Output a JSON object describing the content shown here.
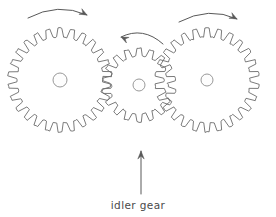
{
  "diagram": {
    "background_color": "#ffffff",
    "stroke_color": "#6b6b6b",
    "arrow_color": "#585858",
    "text_color": "#4a4a4a",
    "gears": [
      {
        "id": "left-gear",
        "role": "driver gear",
        "cx": 60,
        "cy": 80,
        "outer_radius": 52,
        "root_radius": 43,
        "teeth": 26,
        "hub_radius": 7,
        "rotation_direction": "clockwise"
      },
      {
        "id": "middle-gear",
        "role": "idler gear",
        "cx": 139,
        "cy": 85,
        "outer_radius": 37,
        "root_radius": 29,
        "teeth": 18,
        "hub_radius": 6,
        "rotation_direction": "counter-clockwise"
      },
      {
        "id": "right-gear",
        "role": "driven gear",
        "cx": 207,
        "cy": 80,
        "outer_radius": 52,
        "root_radius": 43,
        "teeth": 26,
        "hub_radius": 6,
        "rotation_direction": "clockwise"
      }
    ],
    "rotation_arrows": [
      {
        "id": "left-rotation-arrow",
        "direction": "clockwise",
        "path": "M 28,18 Q 58,2 87,15",
        "head_x": 87,
        "head_y": 15,
        "head_angle": 28
      },
      {
        "id": "middle-rotation-arrow",
        "direction": "counter-clockwise",
        "path": "M 163,44 Q 143,26 121,37",
        "head_x": 121,
        "head_y": 37,
        "head_angle": 205
      },
      {
        "id": "right-rotation-arrow",
        "direction": "clockwise",
        "path": "M 179,22 Q 209,6 237,19",
        "head_x": 237,
        "head_y": 19,
        "head_angle": 28
      }
    ],
    "pointer": {
      "id": "idler-pointer-arrow",
      "x": 141,
      "y_tail": 194,
      "y_head": 151,
      "direction": "up"
    },
    "label": {
      "id": "idler-gear-label",
      "text": "idler gear",
      "x": 138,
      "y": 209,
      "anchor": "middle"
    }
  }
}
